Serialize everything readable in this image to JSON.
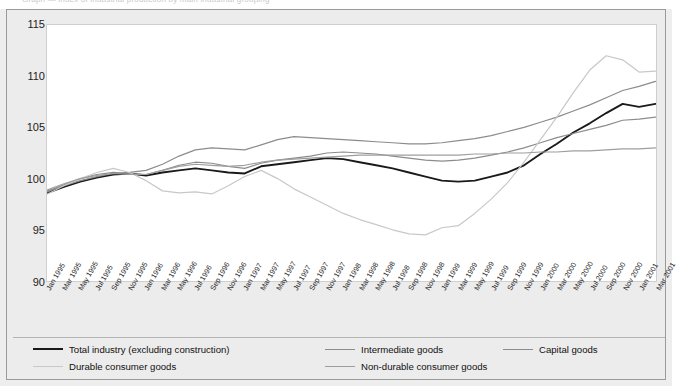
{
  "figure": {
    "top_partial_text": "Graph — index of industrial production by main industrial grouping",
    "background": "#ececec",
    "plot_background": "#ffffff"
  },
  "chart_data": {
    "type": "line",
    "title": "",
    "subtitle": "",
    "xlabel": "",
    "ylabel": "",
    "ylim": [
      90,
      115
    ],
    "yticks": [
      90,
      95,
      100,
      105,
      110,
      115
    ],
    "grid": false,
    "legend_position": "bottom",
    "x": [
      "Jan 1995",
      "Mar 1995",
      "May 1995",
      "Jul 1995",
      "Sep 1995",
      "Nov 1995",
      "Jan 1996",
      "Mar 1996",
      "May 1996",
      "Jul 1996",
      "Sep 1996",
      "Nov 1996",
      "Jan 1997",
      "Mar 1997",
      "May 1997",
      "Jul 1997",
      "Sep 1997",
      "Nov 1997",
      "Jan 1998",
      "Mar 1998",
      "May 1998",
      "Jul 1998",
      "Sep 1998",
      "Nov 1998",
      "Jan 1999",
      "Mar 1999",
      "May 1999",
      "Jul 1999",
      "Sep 1999",
      "Nov 1999",
      "Jan 2000",
      "Mar 2000",
      "May 2000",
      "Jul 2000",
      "Sep 2000",
      "Nov 2000",
      "Jan 2001",
      "Mar 2001"
    ],
    "series": [
      {
        "name": "Total industry (excluding construction)",
        "color": "#1a1a1a",
        "width": 1.9,
        "values": [
          98.6,
          99.2,
          99.7,
          100.1,
          100.4,
          100.5,
          100.3,
          100.6,
          100.8,
          101.0,
          100.8,
          100.6,
          100.5,
          101.2,
          101.4,
          101.6,
          101.8,
          102.0,
          101.9,
          101.6,
          101.3,
          101.0,
          100.6,
          100.2,
          99.8,
          99.7,
          99.8,
          100.2,
          100.6,
          101.3,
          102.4,
          103.4,
          104.5,
          105.4,
          106.4,
          107.3,
          107.0,
          107.3
        ]
      },
      {
        "name": "Intermediate goods",
        "color": "#8c8c8c",
        "width": 1.2,
        "values": [
          98.7,
          99.4,
          100.0,
          100.4,
          100.6,
          100.5,
          100.4,
          100.8,
          101.3,
          101.6,
          101.5,
          101.2,
          101.0,
          101.5,
          101.8,
          102.0,
          102.2,
          102.5,
          102.6,
          102.5,
          102.4,
          102.2,
          102.0,
          101.8,
          101.7,
          101.8,
          102.0,
          102.3,
          102.6,
          103.0,
          103.5,
          104.0,
          104.4,
          104.8,
          105.2,
          105.7,
          105.8,
          106.0
        ]
      },
      {
        "name": "Capital goods",
        "color": "#8c8c8c",
        "width": 1.2,
        "values": [
          98.8,
          99.3,
          99.8,
          100.2,
          100.5,
          100.6,
          100.8,
          101.4,
          102.2,
          102.8,
          103.0,
          102.9,
          102.8,
          103.3,
          103.8,
          104.1,
          104.0,
          103.9,
          103.8,
          103.7,
          103.6,
          103.5,
          103.4,
          103.4,
          103.5,
          103.7,
          103.9,
          104.2,
          104.6,
          105.0,
          105.5,
          106.0,
          106.6,
          107.2,
          107.9,
          108.6,
          109.0,
          109.5
        ]
      },
      {
        "name": "Durable consumer goods",
        "color": "#c8c8c8",
        "width": 1.2,
        "values": [
          98.5,
          99.3,
          100.0,
          100.6,
          101.0,
          100.6,
          99.8,
          98.8,
          98.6,
          98.7,
          98.5,
          99.3,
          100.2,
          100.8,
          100.0,
          99.0,
          98.2,
          97.4,
          96.6,
          96.0,
          95.5,
          95.0,
          94.6,
          94.5,
          95.2,
          95.4,
          96.6,
          98.0,
          99.6,
          101.6,
          103.8,
          106.0,
          108.4,
          110.6,
          112.0,
          111.6,
          110.4,
          110.5
        ]
      },
      {
        "name": "Non-durable consumer goods",
        "color": "#9e9e9e",
        "width": 1.2,
        "values": [
          98.9,
          99.5,
          100.0,
          100.3,
          100.5,
          100.4,
          100.4,
          100.8,
          101.2,
          101.4,
          101.3,
          101.2,
          101.3,
          101.6,
          101.8,
          101.9,
          102.0,
          102.1,
          102.2,
          102.3,
          102.3,
          102.3,
          102.3,
          102.3,
          102.3,
          102.3,
          102.4,
          102.4,
          102.5,
          102.5,
          102.6,
          102.6,
          102.7,
          102.7,
          102.8,
          102.9,
          102.9,
          103.0
        ]
      }
    ],
    "legend": [
      {
        "label": "Total industry (excluding construction)",
        "color": "#1a1a1a",
        "width": 2.2
      },
      {
        "label": "Intermediate goods",
        "color": "#8c8c8c",
        "width": 1.3
      },
      {
        "label": "Capital goods",
        "color": "#8c8c8c",
        "width": 1.3
      },
      {
        "label": "Durable consumer goods",
        "color": "#c8c8c8",
        "width": 1.3
      },
      {
        "label": "Non-durable consumer goods",
        "color": "#9e9e9e",
        "width": 1.3
      }
    ]
  }
}
